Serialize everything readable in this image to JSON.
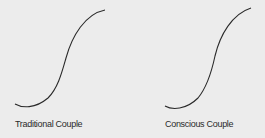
{
  "diagrams": [
    {
      "label": "Traditional Couple",
      "curve": "M15,104 C22,108 35,109 48,98 C58,88 62,72 66,58 C72,36 85,14 105,10"
    },
    {
      "label": "Conscious Couple",
      "curve": "M165,106 C172,110 186,110 198,98 C208,86 212,70 215,56 C220,35 232,14 251,8"
    }
  ],
  "colors": {
    "background": "#ececec",
    "stroke": "#2a2a2a"
  }
}
